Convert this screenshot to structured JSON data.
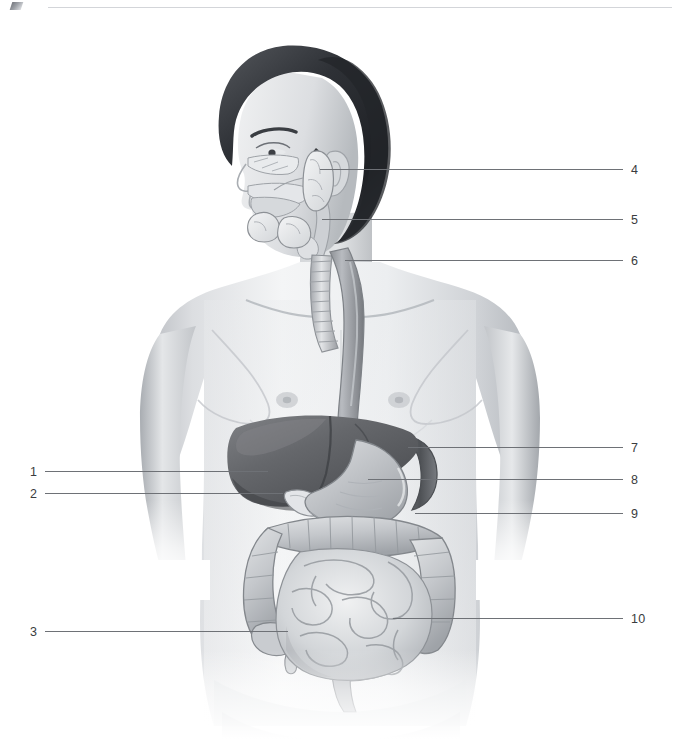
{
  "page": {
    "background_color": "#ffffff",
    "width": 680,
    "height": 739
  },
  "header": {
    "rule_color": "#d3d5d9",
    "corner_mark_name": "scan-artifact"
  },
  "figure": {
    "caption": "",
    "view": "anterior torso with head in left profile",
    "style": "grayscale medical illustration",
    "colors": {
      "skin_light": "#f2f3f4",
      "skin_mid": "#d7d9dc",
      "skin_shadow": "#a7abb0",
      "hair_dark": "#2b2d31",
      "liver": "#6a6c70",
      "liver_shadow": "#4e5054",
      "stomach": "#b9bcc0",
      "intestine": "#c6c9cd",
      "outline": "#5c5f63",
      "esophagus": "#9a9da1",
      "gland": "#e4e6e8",
      "leader_line": "#6e7176",
      "number_text": "#3a3c40"
    },
    "organs": [
      {
        "id": "parotid-gland",
        "label_number": "4"
      },
      {
        "id": "sublingual-glands",
        "label_number": "5"
      },
      {
        "id": "esophagus",
        "label_number": "6"
      },
      {
        "id": "diaphragm",
        "label_number": "7"
      },
      {
        "id": "stomach",
        "label_number": "8"
      },
      {
        "id": "transverse-colon",
        "label_number": "9"
      },
      {
        "id": "small-intestine",
        "label_number": "10"
      },
      {
        "id": "liver",
        "label_number": "1"
      },
      {
        "id": "gallbladder",
        "label_number": "2"
      },
      {
        "id": "appendix-cecum",
        "label_number": "3"
      }
    ]
  },
  "labels": [
    {
      "number": "1",
      "side": "left",
      "num_x": 30,
      "num_y": 466,
      "line_x": 45,
      "line_y": 471,
      "line_w": 223
    },
    {
      "number": "2",
      "side": "left",
      "num_x": 30,
      "num_y": 488,
      "line_x": 45,
      "line_y": 493,
      "line_w": 238
    },
    {
      "number": "3",
      "side": "left",
      "num_x": 30,
      "num_y": 626,
      "line_x": 45,
      "line_y": 631,
      "line_w": 243
    },
    {
      "number": "4",
      "side": "right",
      "num_x": 631,
      "num_y": 164,
      "line_x": 320,
      "line_y": 169,
      "line_w": 303
    },
    {
      "number": "5",
      "side": "right",
      "num_x": 631,
      "num_y": 214,
      "line_x": 322,
      "line_y": 219,
      "line_w": 301
    },
    {
      "number": "6",
      "side": "right",
      "num_x": 631,
      "num_y": 255,
      "line_x": 345,
      "line_y": 260,
      "line_w": 278
    },
    {
      "number": "7",
      "side": "right",
      "num_x": 631,
      "num_y": 442,
      "line_x": 408,
      "line_y": 447,
      "line_w": 215
    },
    {
      "number": "8",
      "side": "right",
      "num_x": 631,
      "num_y": 474,
      "line_x": 368,
      "line_y": 479,
      "line_w": 255
    },
    {
      "number": "9",
      "side": "right",
      "num_x": 631,
      "num_y": 508,
      "line_x": 415,
      "line_y": 513,
      "line_w": 208
    },
    {
      "number": "10",
      "side": "right",
      "num_x": 631,
      "num_y": 613,
      "line_x": 393,
      "line_y": 618,
      "line_w": 230
    }
  ]
}
